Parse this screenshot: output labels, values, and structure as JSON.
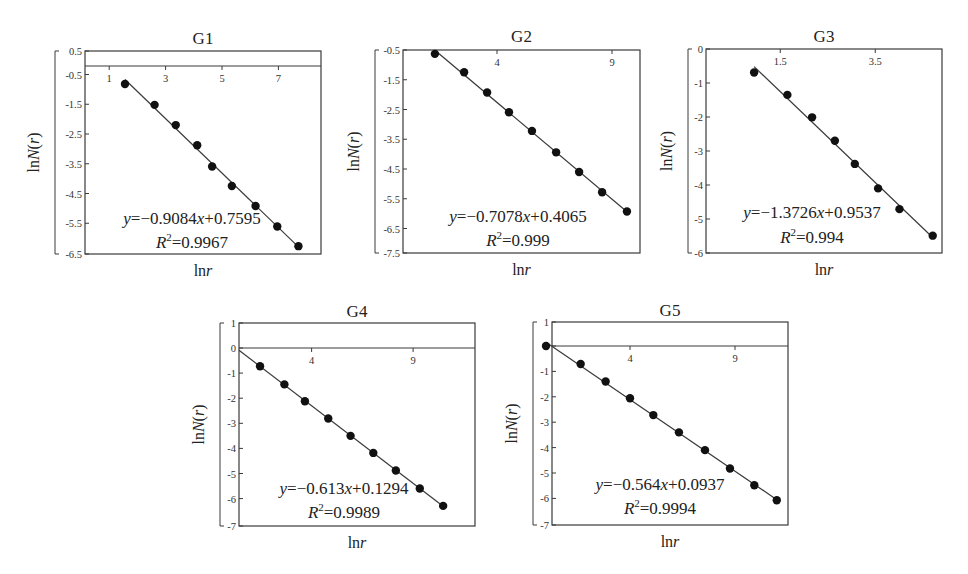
{
  "figure": {
    "axis_label_x": "lnr",
    "axis_label_y": "lnN(r)"
  },
  "chart_data": [
    {
      "type": "scatter",
      "id": "G1",
      "title": "G1",
      "xlabel": "lnr",
      "ylabel": "lnN(r)",
      "x_ticks": [
        "1",
        "3",
        "5",
        "7"
      ],
      "x_tick_values": [
        1,
        3,
        5,
        7
      ],
      "y_ticks": [
        "0.5",
        "-0.5",
        "-1.5",
        "-2.5",
        "-3.5",
        "-4.5",
        "-5.5",
        "-6.5"
      ],
      "y_tick_values": [
        0.5,
        -0.5,
        -1.5,
        -2.5,
        -3.5,
        -4.5,
        -5.5,
        -6.5
      ],
      "xlim": [
        0,
        8.5
      ],
      "ylim": [
        -6.5,
        0.5
      ],
      "grid": false,
      "points": {
        "x": [
          1.56,
          2.61,
          3.36,
          4.12,
          4.65,
          5.35,
          6.19,
          6.96,
          7.71
        ],
        "y": [
          -0.82,
          -1.52,
          -2.2,
          -2.88,
          -3.59,
          -4.25,
          -4.92,
          -5.61,
          -6.27
        ]
      },
      "fit": {
        "slope": -0.9084,
        "intercept": 0.7595,
        "r2": 0.9967
      },
      "equation": "y=−0.9084x+0.7595",
      "r2_label": "R²=0.9967"
    },
    {
      "type": "scatter",
      "id": "G2",
      "title": "G2",
      "xlabel": "lnr",
      "ylabel": "lnN(r)",
      "x_ticks": [
        "4",
        "9"
      ],
      "x_tick_values": [
        4,
        9
      ],
      "y_ticks": [
        "-0.5",
        "-1.5",
        "-2.5",
        "-3.5",
        "-4.5",
        "-5.5",
        "-6.5",
        "-7.5"
      ],
      "y_tick_values": [
        -0.5,
        -1.5,
        -2.5,
        -3.5,
        -4.5,
        -5.5,
        -6.5,
        -7.5
      ],
      "xlim": [
        0,
        10
      ],
      "ylim": [
        -7.5,
        -0.5
      ],
      "grid": false,
      "points": {
        "x": [
          1.3,
          2.57,
          3.57,
          4.52,
          5.52,
          6.57,
          7.57,
          8.57,
          9.65
        ],
        "y": [
          -0.63,
          -1.25,
          -1.93,
          -2.59,
          -3.22,
          -3.94,
          -4.6,
          -5.28,
          -5.93
        ]
      },
      "fit": {
        "slope": -0.7078,
        "intercept": 0.4065,
        "r2": 0.999
      },
      "equation": "y=−0.7078x+0.4065",
      "r2_label": "R²=0.999"
    },
    {
      "type": "scatter",
      "id": "G3",
      "title": "G3",
      "xlabel": "lnr",
      "ylabel": "lnN(r)",
      "x_ticks": [
        "1.5",
        "3.5"
      ],
      "x_tick_values": [
        1.5,
        3.5
      ],
      "y_ticks": [
        "0",
        "-1",
        "-2",
        "-3",
        "-4",
        "-5",
        "-6"
      ],
      "y_tick_values": [
        0,
        -1,
        -2,
        -3,
        -4,
        -5,
        -6
      ],
      "xlim": [
        0,
        5
      ],
      "ylim": [
        -6,
        0
      ],
      "grid": false,
      "points": {
        "x": [
          0.95,
          1.65,
          2.17,
          2.65,
          3.07,
          3.56,
          4.01,
          4.71
        ],
        "y": [
          -0.69,
          -1.35,
          -2.01,
          -2.7,
          -3.38,
          -4.1,
          -4.71,
          -5.49
        ]
      },
      "fit": {
        "slope": -1.3726,
        "intercept": 0.9537,
        "r2": 0.994
      },
      "equation": "y=−1.3726x+0.9537",
      "r2_label": "R²=0.994"
    },
    {
      "type": "scatter",
      "id": "G4",
      "title": "G4",
      "xlabel": "lnr",
      "ylabel": "lnN(r)",
      "x_ticks": [
        "4",
        "9"
      ],
      "x_tick_values": [
        4,
        9
      ],
      "y_ticks": [
        "1",
        "0",
        "-1",
        "-2",
        "-3",
        "-4",
        "-5",
        "-6",
        "-7"
      ],
      "y_tick_values": [
        1,
        0,
        -1,
        -2,
        -3,
        -4,
        -5,
        -6,
        -7
      ],
      "xlim": [
        0,
        12
      ],
      "ylim": [
        -7,
        1
      ],
      "grid": false,
      "points": {
        "x": [
          1.46,
          2.66,
          3.67,
          4.82,
          5.92,
          7.04,
          8.15,
          9.33,
          10.48
        ],
        "y": [
          -0.73,
          -1.45,
          -2.12,
          -2.81,
          -3.5,
          -4.18,
          -4.88,
          -5.6,
          -6.29
        ]
      },
      "fit": {
        "slope": -0.613,
        "intercept": 0.1294,
        "r2": 0.9989
      },
      "equation": "y=−0.613x+0.1294",
      "r2_label": "R²=0.9989"
    },
    {
      "type": "scatter",
      "id": "G5",
      "title": "G5",
      "xlabel": "lnr",
      "ylabel": "lnN(r)",
      "x_ticks": [
        "4",
        "9"
      ],
      "x_tick_values": [
        4,
        9
      ],
      "y_ticks": [
        "1",
        "0",
        "-1",
        "-2",
        "-3",
        "-4",
        "-5",
        "-6",
        "-7"
      ],
      "y_tick_values": [
        1,
        0,
        -1,
        -2,
        -3,
        -4,
        -5,
        -6,
        -7
      ],
      "xlim": [
        0,
        11.5
      ],
      "ylim": [
        -7,
        1
      ],
      "grid": false,
      "points": {
        "x": [
          0.0,
          1.65,
          2.84,
          4.0,
          5.11,
          6.33,
          7.57,
          8.76,
          9.92,
          10.99
        ],
        "y": [
          0.0,
          -0.71,
          -1.4,
          -2.06,
          -2.72,
          -3.4,
          -4.1,
          -4.82,
          -5.48,
          -6.07
        ]
      },
      "fit": {
        "slope": -0.564,
        "intercept": 0.0937,
        "r2": 0.9994
      },
      "equation": "y=−0.564x+0.0937",
      "r2_label": "R²=0.9994"
    }
  ]
}
